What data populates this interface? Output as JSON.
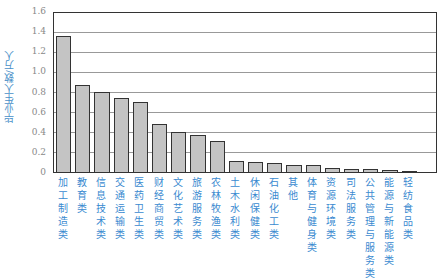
{
  "chart_data": {
    "type": "bar",
    "title": "",
    "xlabel": "",
    "ylabel": "毕业生人数/万人",
    "ylim": [
      0,
      1.6
    ],
    "yticks": [
      0,
      0.2,
      0.4,
      0.6,
      0.8,
      1.0,
      1.2,
      1.4,
      1.6
    ],
    "ytick_labels": [
      "0",
      "0.2",
      "0.4",
      "0.6",
      "0.8",
      "1.0",
      "1.2",
      "1.4",
      "1.6"
    ],
    "grid": true,
    "legend": null,
    "categories": [
      "加工制造类",
      "教育类",
      "信息技术类",
      "交通运输类",
      "医药卫生类",
      "财经商贸类",
      "文化艺术类",
      "旅游服务类",
      "农林牧渔类",
      "土木水利类",
      "休闲保健类",
      "石油化工类",
      "其他",
      "体育与健身类",
      "资源环境类",
      "司法服务类",
      "公共管理与服务类",
      "能源与新能源类",
      "轻纺食品类"
    ],
    "values": [
      1.38,
      0.88,
      0.81,
      0.75,
      0.71,
      0.49,
      0.41,
      0.37,
      0.31,
      0.11,
      0.1,
      0.09,
      0.07,
      0.07,
      0.04,
      0.035,
      0.03,
      0.02,
      0.01
    ],
    "colors": {
      "bar": "#c4c4c4",
      "bar_border": "#333333",
      "category_text": "#3a8ad0",
      "axis_label": "#4a90c8",
      "tick_text": "#888888",
      "grid": "#999999"
    }
  }
}
